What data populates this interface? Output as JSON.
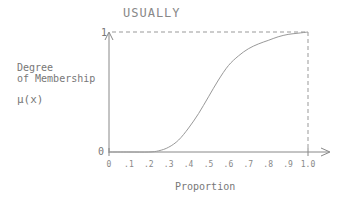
{
  "chart_data": {
    "type": "line",
    "title": "USUALLY",
    "xlabel": "Proportion",
    "ylabel": [
      "Degree",
      "of Membership",
      "μ(x)"
    ],
    "xlim": [
      0,
      1.0
    ],
    "ylim": [
      0,
      1
    ],
    "x_tick_labels": [
      "0",
      ".1",
      ".2",
      ".3",
      ".4",
      ".5",
      ".6",
      ".7",
      ".8",
      ".9",
      "1.0"
    ],
    "y_tick_labels": [
      "0",
      "1"
    ],
    "grid": false,
    "legend": null,
    "series": [
      {
        "name": "usually",
        "x": [
          0,
          0.1,
          0.2,
          0.25,
          0.3,
          0.35,
          0.4,
          0.45,
          0.5,
          0.55,
          0.6,
          0.65,
          0.7,
          0.75,
          0.8,
          0.85,
          0.9,
          0.95,
          1.0
        ],
        "y": [
          0,
          0,
          0,
          0.01,
          0.04,
          0.1,
          0.2,
          0.32,
          0.46,
          0.6,
          0.72,
          0.8,
          0.86,
          0.9,
          0.93,
          0.96,
          0.98,
          0.99,
          1.0
        ]
      }
    ],
    "annotations": [
      "dashed reference lines at y=1 and x=1.0"
    ]
  },
  "labels": {
    "title": "USUALLY",
    "ylabel_line1": "Degree",
    "ylabel_line2": "of Membership",
    "ylabel_line3": "μ(x)",
    "xlabel": "Proportion",
    "y_one": "1",
    "y_zero": "0"
  }
}
